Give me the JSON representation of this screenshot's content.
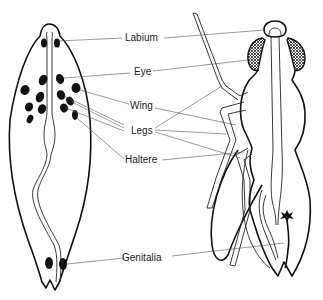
{
  "diagram": {
    "title": "",
    "left_figure": "embryo fate map (ventral view)",
    "right_figure": "adult fly (lateral view)",
    "labels": [
      {
        "id": "labium",
        "text": "Labium"
      },
      {
        "id": "eye",
        "text": "Eye"
      },
      {
        "id": "wing",
        "text": "Wing"
      },
      {
        "id": "legs",
        "text": "Legs"
      },
      {
        "id": "haltere",
        "text": "Haltere"
      },
      {
        "id": "genitalia",
        "text": "Genitalia"
      }
    ],
    "colors": {
      "line": "#111111",
      "leader": "#555555",
      "background": "#ffffff"
    }
  }
}
